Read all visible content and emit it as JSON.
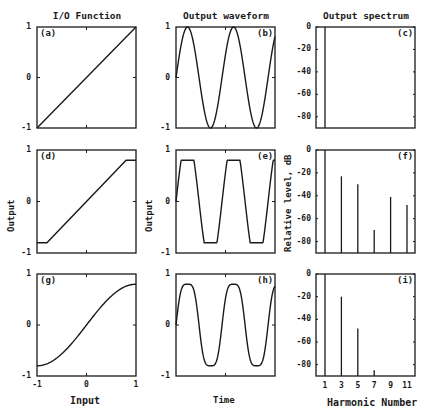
{
  "chart_data": [
    {
      "id": "a",
      "type": "line",
      "tag": "(a)",
      "title": "I/O Function",
      "xlabel": "",
      "ylabel": "",
      "xlim": [
        -1,
        1
      ],
      "ylim": [
        -1,
        1
      ],
      "yticks": [
        "1",
        "0",
        "-1"
      ],
      "x": [
        -1,
        1
      ],
      "y": [
        -1,
        1
      ],
      "description": "linear transfer"
    },
    {
      "id": "b",
      "type": "line",
      "tag": "(b)",
      "title": "Output waveform",
      "xlabel": "",
      "ylabel": "",
      "ylim": [
        -1,
        1
      ],
      "yticks": [
        "1",
        "0",
        "-1"
      ],
      "description": "pure sine, 2 cycles, amplitude 1"
    },
    {
      "id": "c",
      "type": "bar",
      "tag": "(c)",
      "title": "Output spectrum",
      "ylabel": "",
      "ylim": [
        -90,
        0
      ],
      "yticks": [
        "0",
        "-20",
        "-40",
        "-60",
        "-80"
      ],
      "categories": [
        1,
        3,
        5,
        7,
        9,
        11
      ],
      "values": [
        0,
        null,
        null,
        null,
        null,
        null
      ]
    },
    {
      "id": "d",
      "type": "line",
      "tag": "(d)",
      "title": "",
      "xlabel": "",
      "ylabel": "Output",
      "xlim": [
        -1,
        1
      ],
      "ylim": [
        -1,
        1
      ],
      "yticks": [
        "1",
        "0",
        "-1"
      ],
      "x": [
        -1,
        -0.8,
        0.8,
        1
      ],
      "y": [
        -0.8,
        -0.8,
        0.8,
        0.8
      ],
      "description": "hard clipping at ±0.8"
    },
    {
      "id": "e",
      "type": "line",
      "tag": "(e)",
      "title": "",
      "xlabel": "",
      "ylabel": "Output",
      "ylim": [
        -1,
        1
      ],
      "yticks": [
        "1",
        "0",
        "-1"
      ],
      "description": "clipped sine (trapezoid), ±0.8"
    },
    {
      "id": "f",
      "type": "bar",
      "tag": "(f)",
      "title": "",
      "ylabel": "Relative level, dB",
      "ylim": [
        -90,
        0
      ],
      "yticks": [
        "0",
        "-20",
        "-40",
        "-60",
        "-80"
      ],
      "categories": [
        1,
        3,
        5,
        7,
        9,
        11
      ],
      "values": [
        0,
        -23,
        -30,
        -70,
        -41,
        -48
      ]
    },
    {
      "id": "g",
      "type": "line",
      "tag": "(g)",
      "title": "",
      "xlabel": "Input",
      "ylabel": "",
      "xlim": [
        -1,
        1
      ],
      "ylim": [
        -1,
        1
      ],
      "yticks": [
        "1",
        "0",
        "-1"
      ],
      "xticks": [
        "-1",
        "0",
        "1"
      ],
      "description": "soft (smooth) saturation, ±0.8"
    },
    {
      "id": "h",
      "type": "line",
      "tag": "(h)",
      "title": "",
      "xlabel": "Time",
      "ylabel": "",
      "ylim": [
        -1,
        1
      ],
      "yticks": [
        "1",
        "0",
        "-1"
      ],
      "description": "soft-clipped sine, ±0.8"
    },
    {
      "id": "i",
      "type": "bar",
      "tag": "(i)",
      "title": "",
      "xlabel": "Harmonic Number",
      "ylabel": "",
      "ylim": [
        -90,
        0
      ],
      "yticks": [
        "0",
        "-20",
        "-40",
        "-60",
        "-80"
      ],
      "xticks": [
        "1",
        "3",
        "5",
        "7",
        "9",
        "11"
      ],
      "categories": [
        1,
        3,
        5,
        7,
        9,
        11
      ],
      "values": [
        0,
        -20,
        -48,
        -85,
        null,
        null
      ]
    }
  ],
  "labels": {
    "col1_title": "I/O Function",
    "col2_title": "Output waveform",
    "col3_title": "Output spectrum",
    "output_d": "Output",
    "output_e": "Output",
    "relative_level": "Relative level, dB",
    "input": "Input",
    "time": "Time",
    "harmonic": "Harmonic Number"
  }
}
